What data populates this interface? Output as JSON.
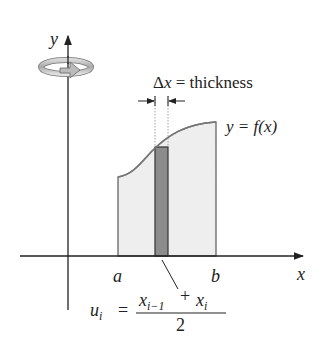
{
  "diagram": {
    "type": "volume-of-revolution-shell-method",
    "axes": {
      "x_label": "x",
      "y_label": "y"
    },
    "rotation_indicator": "rotation about y-axis",
    "curve_label": "y = f(x)",
    "interval": {
      "left_label": "a",
      "right_label": "b"
    },
    "strip_annotation": {
      "delta": "Δ",
      "var": "x",
      "eq": " = thickness"
    },
    "midpoint_formula": {
      "lhs_var": "u",
      "lhs_sub": "i",
      "equals": "=",
      "num_a_var": "x",
      "num_a_sub": "i−1",
      "plus": "+",
      "num_b_var": "x",
      "num_b_sub": "i",
      "denominator": "2"
    },
    "colors": {
      "region_fill": "#eeeeee",
      "strip_fill": "#8c8c8c",
      "outline": "#555555",
      "curve": "#777777",
      "axis": "#222222"
    }
  }
}
